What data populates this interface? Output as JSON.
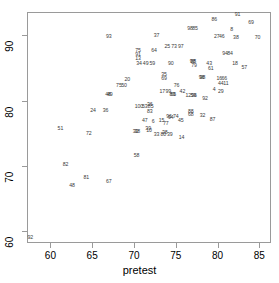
{
  "chart_data": {
    "type": "scatter",
    "title": "",
    "subtitle": "",
    "xlabel": "pretest",
    "ylabel": "",
    "xlim": [
      57.2,
      86.4
    ],
    "ylim": [
      58.2,
      93.6
    ],
    "xticks": [
      60,
      65,
      70,
      75,
      80,
      85
    ],
    "yticks": [
      60,
      70,
      80,
      90
    ],
    "grid": false,
    "legend": null,
    "marker_style": "numeric-id-labels",
    "annotations": [],
    "points": [
      {
        "label": "92",
        "x": 57.6,
        "y": 58.9
      },
      {
        "label": "48",
        "x": 62.6,
        "y": 67.0
      },
      {
        "label": "82",
        "x": 61.8,
        "y": 70.1
      },
      {
        "label": "81",
        "x": 64.3,
        "y": 68.2
      },
      {
        "label": "67",
        "x": 67.0,
        "y": 67.5
      },
      {
        "label": "51",
        "x": 61.2,
        "y": 75.6
      },
      {
        "label": "72",
        "x": 64.6,
        "y": 74.9
      },
      {
        "label": "58",
        "x": 70.3,
        "y": 71.5
      },
      {
        "label": "24",
        "x": 65.1,
        "y": 78.4
      },
      {
        "label": "36",
        "x": 66.6,
        "y": 78.4
      },
      {
        "label": "48",
        "x": 66.9,
        "y": 80.9
      },
      {
        "label": "49",
        "x": 67.1,
        "y": 80.9
      },
      {
        "label": "75",
        "x": 68.2,
        "y": 82.3
      },
      {
        "label": "50",
        "x": 68.8,
        "y": 82.3
      },
      {
        "label": "20",
        "x": 69.2,
        "y": 83.2
      },
      {
        "label": "93",
        "x": 67.0,
        "y": 89.7
      },
      {
        "label": "100",
        "x": 70.6,
        "y": 79.1
      },
      {
        "label": "53",
        "x": 71.3,
        "y": 79.1
      },
      {
        "label": "36",
        "x": 71.9,
        "y": 79.3
      },
      {
        "label": "85",
        "x": 72.0,
        "y": 79.0
      },
      {
        "label": "83",
        "x": 71.9,
        "y": 78.3
      },
      {
        "label": "30",
        "x": 70.2,
        "y": 75.2
      },
      {
        "label": "38",
        "x": 70.4,
        "y": 75.2
      },
      {
        "label": "39",
        "x": 71.7,
        "y": 75.7
      },
      {
        "label": "10",
        "x": 71.8,
        "y": 75.4
      },
      {
        "label": "47",
        "x": 71.3,
        "y": 76.9
      },
      {
        "label": "6",
        "x": 72.3,
        "y": 76.8
      },
      {
        "label": "15",
        "x": 73.3,
        "y": 76.9
      },
      {
        "label": "77",
        "x": 73.8,
        "y": 76.5
      },
      {
        "label": "33",
        "x": 72.7,
        "y": 74.8
      },
      {
        "label": "80",
        "x": 73.5,
        "y": 74.8
      },
      {
        "label": "39",
        "x": 74.3,
        "y": 74.8
      },
      {
        "label": "38",
        "x": 73.7,
        "y": 75.1
      },
      {
        "label": "14",
        "x": 75.7,
        "y": 74.3
      },
      {
        "label": "96",
        "x": 74.2,
        "y": 77.5
      },
      {
        "label": "94",
        "x": 74.4,
        "y": 77.4
      },
      {
        "label": "74",
        "x": 75.0,
        "y": 77.5
      },
      {
        "label": "45",
        "x": 75.6,
        "y": 76.9
      },
      {
        "label": "88",
        "x": 76.8,
        "y": 78.3
      },
      {
        "label": "68",
        "x": 76.8,
        "y": 77.8
      },
      {
        "label": "32",
        "x": 78.2,
        "y": 77.6
      },
      {
        "label": "87",
        "x": 79.4,
        "y": 77.1
      },
      {
        "label": "17",
        "x": 73.4,
        "y": 81.4
      },
      {
        "label": "99",
        "x": 74.1,
        "y": 81.4
      },
      {
        "label": "89",
        "x": 74.6,
        "y": 80.9
      },
      {
        "label": "65",
        "x": 74.7,
        "y": 80.9
      },
      {
        "label": "42",
        "x": 75.8,
        "y": 81.4
      },
      {
        "label": "12",
        "x": 76.5,
        "y": 80.8
      },
      {
        "label": "59",
        "x": 77.1,
        "y": 80.8
      },
      {
        "label": "96",
        "x": 77.2,
        "y": 80.8
      },
      {
        "label": "76",
        "x": 75.1,
        "y": 82.3
      },
      {
        "label": "35",
        "x": 73.6,
        "y": 84.0
      },
      {
        "label": "69",
        "x": 73.6,
        "y": 83.4
      },
      {
        "label": "96",
        "x": 78.1,
        "y": 83.5
      },
      {
        "label": "98",
        "x": 78.2,
        "y": 83.5
      },
      {
        "label": "16",
        "x": 80.2,
        "y": 83.4
      },
      {
        "label": "66",
        "x": 80.8,
        "y": 83.4
      },
      {
        "label": "44",
        "x": 80.4,
        "y": 82.6
      },
      {
        "label": "11",
        "x": 81.0,
        "y": 82.5
      },
      {
        "label": "4",
        "x": 79.6,
        "y": 81.6
      },
      {
        "label": "29",
        "x": 80.4,
        "y": 81.3
      },
      {
        "label": "92",
        "x": 78.5,
        "y": 80.2
      },
      {
        "label": "34",
        "x": 70.6,
        "y": 85.6
      },
      {
        "label": "49",
        "x": 71.4,
        "y": 85.6
      },
      {
        "label": "59",
        "x": 72.2,
        "y": 85.6
      },
      {
        "label": "90",
        "x": 74.4,
        "y": 85.6
      },
      {
        "label": "75",
        "x": 70.5,
        "y": 87.6
      },
      {
        "label": "91",
        "x": 70.5,
        "y": 87.0
      },
      {
        "label": "13",
        "x": 70.5,
        "y": 86.4
      },
      {
        "label": "64",
        "x": 72.4,
        "y": 87.7
      },
      {
        "label": "25",
        "x": 74.0,
        "y": 88.3
      },
      {
        "label": "73",
        "x": 74.8,
        "y": 88.3
      },
      {
        "label": "97",
        "x": 75.6,
        "y": 88.3
      },
      {
        "label": "37",
        "x": 72.7,
        "y": 89.9
      },
      {
        "label": "98",
        "x": 77.0,
        "y": 85.9
      },
      {
        "label": "88",
        "x": 77.1,
        "y": 85.9
      },
      {
        "label": "79",
        "x": 77.2,
        "y": 85.4
      },
      {
        "label": "43",
        "x": 79.0,
        "y": 85.6
      },
      {
        "label": "61",
        "x": 79.2,
        "y": 84.9
      },
      {
        "label": "18",
        "x": 82.1,
        "y": 85.6
      },
      {
        "label": "57",
        "x": 83.2,
        "y": 85.0
      },
      {
        "label": "94",
        "x": 80.9,
        "y": 87.2
      },
      {
        "label": "84",
        "x": 81.5,
        "y": 87.2
      },
      {
        "label": "27",
        "x": 79.9,
        "y": 89.7
      },
      {
        "label": "46",
        "x": 80.5,
        "y": 89.7
      },
      {
        "label": "38",
        "x": 82.2,
        "y": 89.6
      },
      {
        "label": "70",
        "x": 84.8,
        "y": 89.6
      },
      {
        "label": "98",
        "x": 76.7,
        "y": 91.0
      },
      {
        "label": "85",
        "x": 77.3,
        "y": 91.0
      },
      {
        "label": "8",
        "x": 81.7,
        "y": 90.9
      },
      {
        "label": "86",
        "x": 79.6,
        "y": 92.4
      },
      {
        "label": "69",
        "x": 84.0,
        "y": 91.9
      },
      {
        "label": "91",
        "x": 82.4,
        "y": 93.1
      }
    ]
  }
}
